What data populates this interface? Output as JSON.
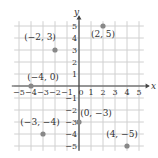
{
  "chart_data": {
    "type": "scatter",
    "title": "",
    "xlabel": "x",
    "ylabel": "y",
    "xlim": [
      -5,
      5
    ],
    "ylim": [
      -5,
      5
    ],
    "grid": true,
    "x_ticks": [
      "-5",
      "-4",
      "-3",
      "-2",
      "-1",
      "0",
      "1",
      "2",
      "3",
      "4",
      "5"
    ],
    "y_ticks": [
      "5",
      "4",
      "3",
      "2",
      "1",
      "-1",
      "-2",
      "-3",
      "-4",
      "-5"
    ],
    "points": [
      {
        "x": -2,
        "y": 3,
        "label": "(−2, 3)"
      },
      {
        "x": 2,
        "y": 5,
        "label": "(2, 5)"
      },
      {
        "x": -4,
        "y": 0,
        "label": "(−4, 0)"
      },
      {
        "x": 0,
        "y": -3,
        "label": "(0, −3)"
      },
      {
        "x": -3,
        "y": -4,
        "label": "(−3, −4)"
      },
      {
        "x": 4,
        "y": -5,
        "label": "(4, −5)"
      }
    ],
    "point_color": "#888888",
    "grid_color": "#d0d0d0",
    "axis_color": "#444444"
  }
}
